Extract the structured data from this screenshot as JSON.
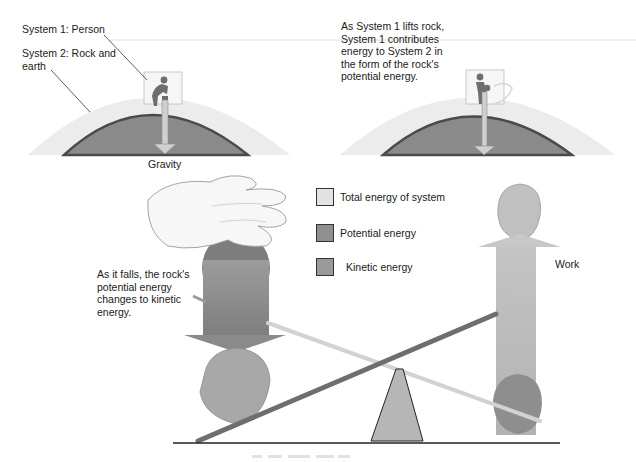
{
  "panels": {
    "left": {
      "system1_label": "System 1: Person",
      "system2_label": "System 2: Rock and\nearth",
      "force_label": "Gravity"
    },
    "right": {
      "caption": "As System 1 lifts rock,\nSystem 1 contributes\nenergy to System 2 in\nthe form of the rock's\npotential energy."
    }
  },
  "lower": {
    "falling_caption": "As it falls, the rock's\npotential energy\nchanges to kinetic\nenergy.",
    "work_label": "Work"
  },
  "legend": {
    "items": [
      {
        "label": "Total energy of system",
        "color": "#e2e2e2"
      },
      {
        "label": "Potential energy",
        "color": "#8f8f8f"
      },
      {
        "label": "Kinetic energy",
        "color": "#9a9a9a"
      }
    ]
  },
  "colors": {
    "atmosphere": "#ececec",
    "earth": "#8a8a8a",
    "earth_edge": "#4a4a4a",
    "arrow_light": "#cfcfcf",
    "arrow_dark": "#8c8c8c",
    "rock": "#a8a8a8",
    "fulcrum": "#b8b8b8",
    "lever": "#7a7a7a"
  }
}
